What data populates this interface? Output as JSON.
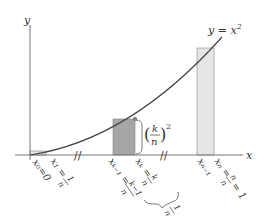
{
  "diagram": {
    "axes": {
      "x_label": "x",
      "y_label": "y"
    },
    "curve": {
      "label": "y = x²",
      "label_base": "y = x",
      "label_exp": "2"
    },
    "bars": [
      {
        "name": "first-rectangle",
        "color": "#e6e6e6"
      },
      {
        "name": "kth-rectangle",
        "color": "#a6a6a6"
      },
      {
        "name": "last-rectangle",
        "color": "#e6e6e6"
      }
    ],
    "height_label": {
      "num": "k",
      "den": "n",
      "exp": "2"
    },
    "break_marks": [
      "//",
      "//"
    ],
    "tick_labels": [
      {
        "text": "x₀=0"
      },
      {
        "text": "x₁ = 1/n",
        "var": "x₁ =",
        "num": "1",
        "den": "n"
      },
      {
        "text": "xₖ₋₁ = (k−1)/n",
        "var": "xₖ₋₁ =",
        "num": "k−1",
        "den": "n"
      },
      {
        "text": "xₖ = k/n",
        "var": "xₖ =",
        "num": "k",
        "den": "n"
      },
      {
        "text": "xₙ₋₁"
      },
      {
        "text": "xₙ = n/n = 1",
        "var": "xₙ =",
        "num": "n",
        "den": "n",
        "tail": "= 1"
      }
    ],
    "width_label": {
      "num": "1",
      "den": "n"
    },
    "colors": {
      "axis": "#777777",
      "curve": "#444444",
      "dark_bar": "#a6a6a6",
      "light_bar": "#e6e6e6",
      "bar_stroke": "#888888"
    }
  }
}
